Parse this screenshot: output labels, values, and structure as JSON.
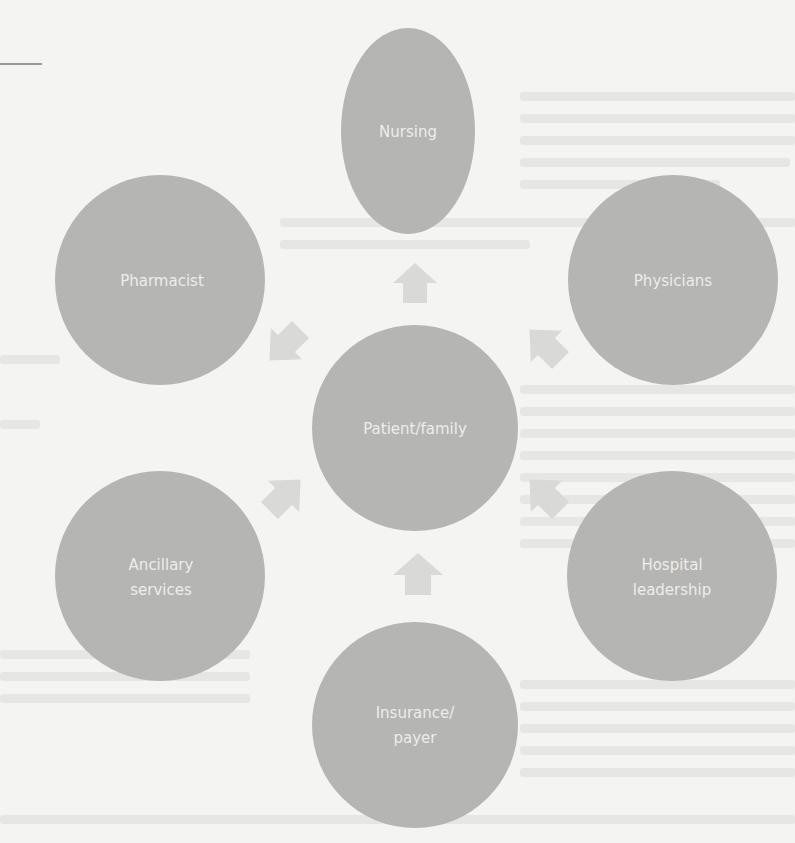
{
  "diagram": {
    "title": "",
    "center": {
      "id": "patient-family",
      "lines": [
        "Patient/family"
      ]
    },
    "nodes": [
      {
        "id": "nursing",
        "lines": [
          "Nursing"
        ]
      },
      {
        "id": "pharmacist",
        "lines": [
          "Pharmacist"
        ]
      },
      {
        "id": "physicians",
        "lines": [
          "Physicians"
        ]
      },
      {
        "id": "ancillary-services",
        "lines": [
          "Ancillary",
          "services"
        ]
      },
      {
        "id": "hospital-leadership",
        "lines": [
          "Hospital",
          "leadership"
        ]
      },
      {
        "id": "insurance-payer",
        "lines": [
          "Insurance/",
          "payer"
        ]
      }
    ],
    "edges": [
      {
        "from": "nursing",
        "to": "patient-family"
      },
      {
        "from": "pharmacist",
        "to": "patient-family"
      },
      {
        "from": "physicians",
        "to": "patient-family"
      },
      {
        "from": "ancillary-services",
        "to": "patient-family"
      },
      {
        "from": "hospital-leadership",
        "to": "patient-family"
      },
      {
        "from": "insurance-payer",
        "to": "patient-family"
      }
    ],
    "colors": {
      "circle": "#b5b5b3",
      "arrow": "#d9d9d7",
      "label": "#ededeb",
      "background": "#f4f4f2"
    }
  }
}
